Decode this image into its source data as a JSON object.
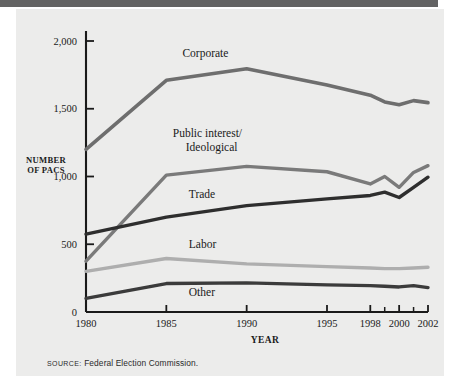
{
  "figure": {
    "source_prefix": "SOURCE:",
    "source_text": "Federal Election Commission."
  },
  "chart_data": {
    "type": "line",
    "title": "",
    "xlabel": "YEAR",
    "ylabel": "NUMBER OF PACS",
    "ylabel_line1": "NUMBER",
    "ylabel_line2": "OF PACS",
    "grid": false,
    "legend": "inline-labels",
    "x": [
      1980,
      1985,
      1990,
      1995,
      1998,
      1999,
      2000,
      2001,
      2002
    ],
    "xtick_labels": [
      "1980",
      "1985",
      "1990",
      "1995",
      "1998",
      "2000",
      "2002"
    ],
    "xtick_values": [
      1980,
      1985,
      1990,
      1995,
      1998,
      2000,
      2002
    ],
    "xminor_tick_values": [
      1999,
      2001
    ],
    "xlim": [
      1980,
      2002
    ],
    "ylim": [
      0,
      2000
    ],
    "ytick_labels": [
      "0",
      "500",
      "1,000",
      "1,500",
      "2,000"
    ],
    "ytick_values": [
      0,
      500,
      1000,
      1500,
      2000
    ],
    "series": [
      {
        "name": "Corporate",
        "color": "#6e6e6e",
        "width": 3.6,
        "values": [
          1200,
          1710,
          1795,
          1675,
          1600,
          1550,
          1530,
          1560,
          1545
        ],
        "label_x": 1986.0,
        "label_y": 1880
      },
      {
        "name": "Public interest/",
        "name_line2": "Ideological",
        "color": "#7a7a7a",
        "width": 3.4,
        "values": [
          375,
          1010,
          1075,
          1035,
          945,
          1000,
          920,
          1030,
          1080
        ],
        "label_x": 1985.4,
        "label_y": 1290
      },
      {
        "name": "Trade",
        "color": "#2e2e2e",
        "width": 3.4,
        "values": [
          575,
          700,
          785,
          835,
          860,
          885,
          845,
          920,
          995
        ],
        "label_x": 1986.4,
        "label_y": 840
      },
      {
        "name": "Labor",
        "color": "#aeaeae",
        "width": 3.4,
        "values": [
          300,
          395,
          355,
          335,
          325,
          320,
          320,
          325,
          330
        ],
        "label_x": 1986.4,
        "label_y": 470
      },
      {
        "name": "Other",
        "color": "#3b3b3b",
        "width": 3.4,
        "values": [
          100,
          210,
          215,
          200,
          195,
          190,
          185,
          195,
          180
        ],
        "label_x": 1986.4,
        "label_y": 115
      }
    ]
  }
}
